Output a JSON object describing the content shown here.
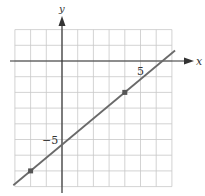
{
  "chart_data": {
    "type": "line",
    "title": "",
    "xlabel": "x",
    "ylabel": "y",
    "xlim": [
      -3,
      7
    ],
    "ylim": [
      -8,
      2
    ],
    "grid": true,
    "tick_labels": [
      {
        "axis": "x",
        "value": 5,
        "label": "5"
      },
      {
        "axis": "y",
        "value": -5,
        "label": "−5"
      }
    ],
    "series": [
      {
        "name": "line",
        "points": [
          {
            "x": -2,
            "y": -7
          },
          {
            "x": 4,
            "y": -2
          }
        ],
        "slope": 0.8333,
        "y_intercept": -5.333,
        "color": "#6a6a6a"
      }
    ],
    "marked_points": [
      {
        "x": 4,
        "y": -2
      },
      {
        "x": -2,
        "y": -7
      }
    ]
  },
  "labels": {
    "x_axis": "x",
    "y_axis": "y",
    "tick_x_5": "5",
    "tick_y_neg5": "−5"
  }
}
